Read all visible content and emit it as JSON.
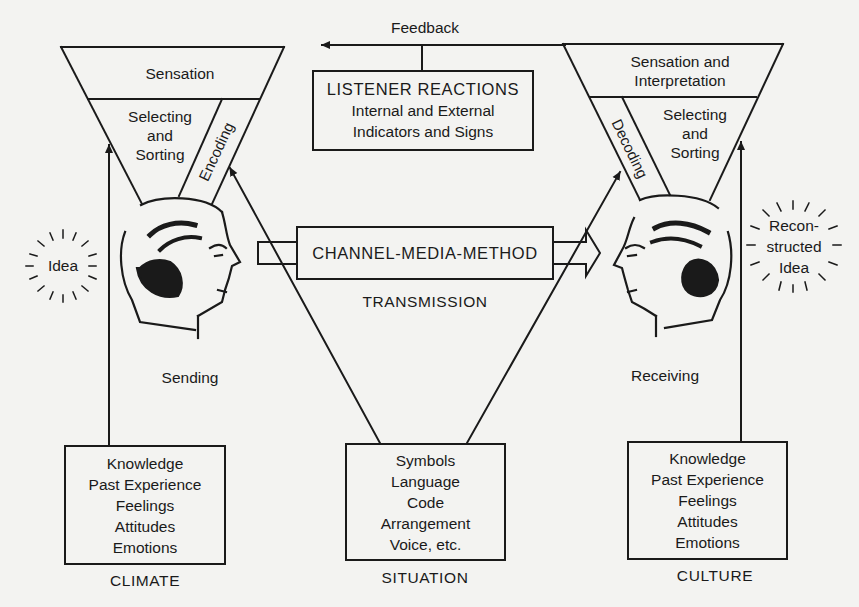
{
  "diagram": {
    "type": "communication-process-model",
    "colors": {
      "ink": "#1a1a1a",
      "paper": "#f3f3f1"
    },
    "feedback": {
      "label": "Feedback",
      "direction": "right-to-left"
    },
    "listener_reactions": {
      "title": "LISTENER REACTIONS",
      "lines": [
        "Internal and External",
        "Indicators and Signs"
      ]
    },
    "sender_funnel": {
      "top": "Sensation",
      "middle": [
        "Selecting",
        "and",
        "Sorting"
      ],
      "side": "Encoding"
    },
    "receiver_funnel": {
      "top": [
        "Sensation and",
        "Interpretation"
      ],
      "middle": [
        "Selecting",
        "and",
        "Sorting"
      ],
      "side": "Decoding"
    },
    "idea": {
      "label": "Idea",
      "icon": "burst-icon"
    },
    "reconstructed_idea": {
      "lines": [
        "Recon-",
        "structed",
        "Idea"
      ],
      "icon": "burst-icon"
    },
    "channel": {
      "label": "CHANNEL-MEDIA-METHOD",
      "caption": "TRANSMISSION"
    },
    "sender": {
      "label": "Sending",
      "icon": "head-profile-right-icon"
    },
    "receiver": {
      "label": "Receiving",
      "icon": "head-profile-left-icon"
    },
    "climate": {
      "items": [
        "Knowledge",
        "Past Experience",
        "Feelings",
        "Attitudes",
        "Emotions"
      ],
      "caption": "CLIMATE"
    },
    "situation": {
      "items": [
        "Symbols",
        "Language",
        "Code",
        "Arrangement",
        "Voice, etc."
      ],
      "caption": "SITUATION"
    },
    "culture": {
      "items": [
        "Knowledge",
        "Past Experience",
        "Feelings",
        "Attitudes",
        "Emotions"
      ],
      "caption": "CULTURE"
    }
  }
}
